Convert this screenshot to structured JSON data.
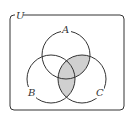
{
  "diagram": {
    "type": "venn",
    "universe_label": "U",
    "sets": [
      {
        "label": "A",
        "cx": 66,
        "cy": 55,
        "r": 24
      },
      {
        "label": "B",
        "cx": 51,
        "cy": 79,
        "r": 24
      },
      {
        "label": "C",
        "cx": 82,
        "cy": 79,
        "r": 24
      }
    ],
    "shaded_regions": [
      "A∩C",
      "B∩C"
    ],
    "colors": {
      "stroke": "#333333",
      "shade": "#d0d0d0",
      "background": "#ffffff"
    }
  }
}
